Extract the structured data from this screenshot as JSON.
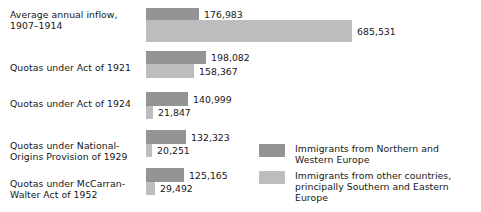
{
  "chart_data": {
    "type": "bar",
    "orientation": "horizontal",
    "title": "",
    "subtitle": "",
    "xlabel": "",
    "ylabel": "",
    "grid": false,
    "axis_visible": false,
    "xlim": [
      0,
      700000
    ],
    "legend_position": "inside-right-bottom",
    "categories": [
      "Average annual inflow,\n1907–1914",
      "Quotas under Act of 1921",
      "Quotas under Act of 1924",
      "Quotas under National-\nOrigins Provision of 1929",
      "Quotas under McCarran-\nWalter Act of 1952"
    ],
    "series": [
      {
        "name": "Immigrants from Northern and\nWestern Europe",
        "color": "#949494",
        "values": [
          176983,
          198082,
          140999,
          132323,
          125165
        ],
        "value_labels": [
          "176,983",
          "198,082",
          "140,999",
          "132,323",
          "125,165"
        ]
      },
      {
        "name": "Immigrants from other countries,\nprincipally Southern and Eastern Europe",
        "color": "#bdbdbd",
        "values": [
          685531,
          158367,
          21847,
          20251,
          29492
        ],
        "value_labels": [
          "685,531",
          "158,367",
          "21,847",
          "20,251",
          "29,492"
        ]
      }
    ],
    "legend": [
      {
        "label": "Immigrants from Northern and\nWestern Europe",
        "color": "#949494"
      },
      {
        "label": "Immigrants from other countries,\nprincipally Southern and Eastern Europe",
        "color": "#bdbdbd"
      }
    ]
  },
  "layout": {
    "bar_origin_x": 146,
    "px_per_unit": 0.0003005,
    "groups": [
      {
        "label_top": 9,
        "dark_top": 8,
        "dark_height": 12,
        "light_top": 20,
        "light_height": 22
      },
      {
        "label_top": 62,
        "dark_top": 51,
        "dark_height": 13,
        "light_top": 64,
        "light_height": 14
      },
      {
        "label_top": 98,
        "dark_top": 92,
        "dark_height": 14,
        "light_top": 106,
        "light_height": 13
      },
      {
        "label_top": 140,
        "dark_top": 130,
        "dark_height": 14,
        "light_top": 144,
        "light_height": 13
      },
      {
        "label_top": 178,
        "dark_top": 168,
        "dark_height": 14,
        "light_top": 182,
        "light_height": 13
      }
    ],
    "legend_rows": [
      {
        "top": 0
      },
      {
        "top": 27
      }
    ]
  },
  "colors": {
    "background": "#ffffff",
    "series_northern_western": "#949494",
    "series_other": "#bdbdbd",
    "text": "#161616"
  }
}
